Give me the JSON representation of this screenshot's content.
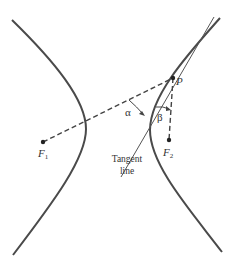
{
  "diagram": {
    "labels": {
      "point_p": "P",
      "focus_1": "F",
      "focus_1_sub": "1",
      "focus_2": "F",
      "focus_2_sub": "2",
      "alpha": "α",
      "beta": "β",
      "tangent_line_1": "Tangent",
      "tangent_line_2": "line"
    },
    "points": {
      "P": [
        173,
        78
      ],
      "F1": [
        43,
        142
      ],
      "F2": [
        169,
        140
      ]
    },
    "colors": {
      "curve": "#4a4a4a",
      "line": "#555555",
      "text": "#333333",
      "background": "#ffffff"
    }
  }
}
